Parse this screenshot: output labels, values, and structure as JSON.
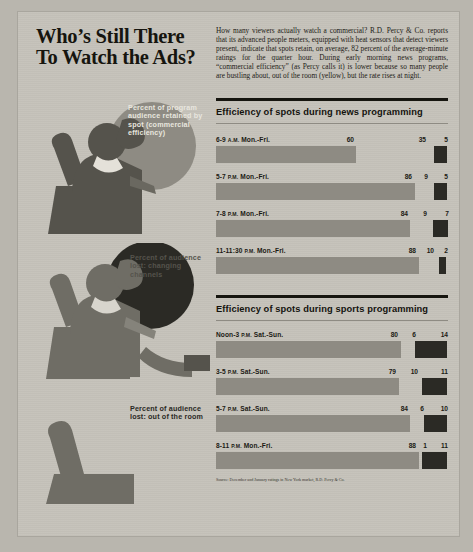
{
  "headline": {
    "line1": "Who’s Still There",
    "line2": "To Watch the Ads?"
  },
  "blurb": "How many viewers actually watch a commercial? R.D. Percy & Co. reports that its advanced people meters, equipped with heat sensors that detect viewers present, indicate that spots retain, on average, 82 percent of the average-minute ratings for the quarter hour. During early morning news programs, “commercial efficiency” (as Percy calls it) is lower because so many people are bustling about, out of the room (yellow), but the rate rises at night.",
  "legend": [
    {
      "id": "retained",
      "label": "Percent of program audience retained by spot (commercial efficiency)",
      "color": "#8e8b83"
    },
    {
      "id": "changing-channels",
      "label": "Percent of audience lost: changing channels",
      "color": "#2b2a25"
    },
    {
      "id": "out-of-room",
      "label": "Percent of audience lost: out of the room",
      "color": "#c6c3bb"
    }
  ],
  "illustrations": [
    {
      "id": "seated-viewer-watching",
      "description": "person seated in armchair facing television"
    },
    {
      "id": "seated-viewer-changing-channels",
      "description": "person seated in armchair holding remote"
    },
    {
      "id": "empty-armchair",
      "description": "empty armchair, viewer has left the room"
    }
  ],
  "source": "Source: December and January ratings in New York market, R.D. Percy & Co.",
  "chart_data": [
    {
      "type": "bar",
      "title": "Efficiency of spots during news programming",
      "orientation": "horizontal",
      "stacked": true,
      "xlabel": "",
      "ylabel": "",
      "xlim": [
        0,
        100
      ],
      "grid": false,
      "legend_position": "left-illustration",
      "categories": [
        "6-9 A.M. Mon.-Fri.",
        "5-7 P.M. Mon.-Fri.",
        "7-8 P.M. Mon.-Fri.",
        "11-11:30 P.M. Mon.-Fri."
      ],
      "series": [
        {
          "name": "Percent of program audience retained by spot (commercial efficiency)",
          "color": "#8e8b83",
          "values": [
            60,
            86,
            84,
            88
          ]
        },
        {
          "name": "Percent of audience lost: out of the room",
          "color": "#c6c3bb",
          "values": [
            35,
            9,
            9,
            10
          ]
        },
        {
          "name": "Percent of audience lost: changing channels",
          "color": "#2b2a25",
          "values": [
            5,
            5,
            7,
            2
          ]
        }
      ]
    },
    {
      "type": "bar",
      "title": "Efficiency of spots during sports programming",
      "orientation": "horizontal",
      "stacked": true,
      "xlabel": "",
      "ylabel": "",
      "xlim": [
        0,
        100
      ],
      "grid": false,
      "legend_position": "left-illustration",
      "categories": [
        "Noon-3 P.M. Sat.-Sun.",
        "3-5 P.M. Sat.-Sun.",
        "5-7 P.M. Sat.-Sun.",
        "8-11 P.M. Mon.-Fri."
      ],
      "series": [
        {
          "name": "Percent of program audience retained by spot (commercial efficiency)",
          "color": "#8e8b83",
          "values": [
            80,
            79,
            84,
            88
          ]
        },
        {
          "name": "Percent of audience lost: out of the room",
          "color": "#c6c3bb",
          "values": [
            6,
            10,
            6,
            1
          ]
        },
        {
          "name": "Percent of audience lost: changing channels",
          "color": "#2b2a25",
          "values": [
            14,
            11,
            10,
            11
          ]
        }
      ]
    }
  ]
}
